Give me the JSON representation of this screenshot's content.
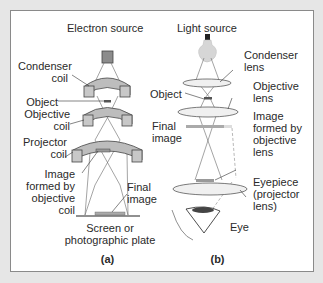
{
  "panel_a": {
    "title": "Electron source",
    "labels": {
      "condenser": [
        "Condenser",
        "coil"
      ],
      "object": "Object",
      "objective": [
        "Objective",
        "coil"
      ],
      "projector": [
        "Projector",
        "coil"
      ],
      "image_formed": [
        "Image",
        "formed by",
        "objective",
        "coil"
      ],
      "final_image": [
        "Final",
        "image"
      ],
      "screen": [
        "Screen or",
        "photographic plate"
      ]
    },
    "caption": "(a)"
  },
  "panel_b": {
    "title": "Light source",
    "labels": {
      "condenser": [
        "Condenser",
        "lens"
      ],
      "object": "Object",
      "objective": [
        "Objective",
        "lens"
      ],
      "final_image": [
        "Final",
        "image"
      ],
      "image_formed": [
        "Image",
        "formed by",
        "objective",
        "lens"
      ],
      "eyepiece": [
        "Eyepiece",
        "(projector",
        "lens)"
      ],
      "eye": "Eye"
    },
    "caption": "(b)"
  },
  "colors": {
    "background": "#e6e6e6",
    "coil_fill": "#bdbdbd",
    "coil_dark": "#8c8c8c",
    "lens_fill": "#f0f0f0",
    "bulb": "#d6d6d6"
  }
}
